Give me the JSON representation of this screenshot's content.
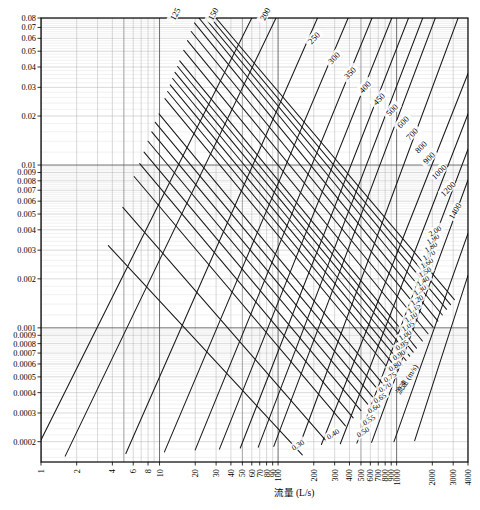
{
  "figure": {
    "kind": "hydraulic-nomogram",
    "width": 480,
    "height": 510,
    "background": "#ffffff",
    "line_color": "#1a1a1a",
    "grid_major_color": "#555555",
    "grid_minor_color": "#aaaaaa"
  },
  "axes": {
    "x_title": "流量 (L/s)",
    "y_title": "",
    "velocity_title": "流速 (m/s)",
    "x_scale": "log",
    "y_scale": "log",
    "x_range": [
      1,
      4000
    ],
    "y_range": [
      0.00015,
      0.08
    ],
    "grid": true
  },
  "x_ticks": [
    {
      "value": 1,
      "label": "1"
    },
    {
      "value": 2,
      "label": "2"
    },
    {
      "value": 4,
      "label": "4"
    },
    {
      "value": 6,
      "label": "6"
    },
    {
      "value": 8,
      "label": "8"
    },
    {
      "value": 10,
      "label": "10"
    },
    {
      "value": 20,
      "label": "20"
    },
    {
      "value": 30,
      "label": "30"
    },
    {
      "value": 40,
      "label": "40"
    },
    {
      "value": 50,
      "label": "50"
    },
    {
      "value": 60,
      "label": "60"
    },
    {
      "value": 70,
      "label": "70"
    },
    {
      "value": 80,
      "label": "80"
    },
    {
      "value": 90,
      "label": "90"
    },
    {
      "value": 100,
      "label": "100"
    },
    {
      "value": 200,
      "label": "200"
    },
    {
      "value": 300,
      "label": "300"
    },
    {
      "value": 400,
      "label": "400"
    },
    {
      "value": 500,
      "label": "500"
    },
    {
      "value": 600,
      "label": "600"
    },
    {
      "value": 700,
      "label": "700"
    },
    {
      "value": 800,
      "label": "800"
    },
    {
      "value": 900,
      "label": "900"
    },
    {
      "value": 1000,
      "label": "1000"
    },
    {
      "value": 2000,
      "label": "2000"
    },
    {
      "value": 3000,
      "label": "3000"
    },
    {
      "value": 4000,
      "label": "4000"
    }
  ],
  "y_ticks": [
    {
      "value": 0.08,
      "label": "0.08"
    },
    {
      "value": 0.07,
      "label": "0.07"
    },
    {
      "value": 0.06,
      "label": "0.06"
    },
    {
      "value": 0.05,
      "label": "0.05"
    },
    {
      "value": 0.04,
      "label": "0.04"
    },
    {
      "value": 0.03,
      "label": "0.03"
    },
    {
      "value": 0.02,
      "label": "0.02"
    },
    {
      "value": 0.01,
      "label": "0.01"
    },
    {
      "value": 0.009,
      "label": "0.009"
    },
    {
      "value": 0.008,
      "label": "0.008"
    },
    {
      "value": 0.007,
      "label": "0.007"
    },
    {
      "value": 0.006,
      "label": "0.006"
    },
    {
      "value": 0.005,
      "label": "0.005"
    },
    {
      "value": 0.004,
      "label": "0.004"
    },
    {
      "value": 0.003,
      "label": "0.003"
    },
    {
      "value": 0.002,
      "label": "0.002"
    },
    {
      "value": 0.001,
      "label": "0.001"
    },
    {
      "value": 0.0009,
      "label": "0.0009"
    },
    {
      "value": 0.0008,
      "label": "0.0008"
    },
    {
      "value": 0.0007,
      "label": "0.0007"
    },
    {
      "value": 0.0006,
      "label": "0.0006"
    },
    {
      "value": 0.0005,
      "label": "0.0005"
    },
    {
      "value": 0.0004,
      "label": "0.0004"
    },
    {
      "value": 0.0003,
      "label": "0.0003"
    },
    {
      "value": 0.0002,
      "label": "0.0002"
    }
  ],
  "chart_data": {
    "type": "line",
    "title": "",
    "subtitle": "",
    "xlabel": "流量 (L/s)",
    "ylabel": "",
    "xlim": [
      1,
      4000
    ],
    "ylim": [
      0.00015,
      0.08
    ],
    "xscale": "log",
    "yscale": "log",
    "grid": true,
    "legend_position": "none",
    "annotations": [
      "流量 (L/s)",
      "流速 (m/s)"
    ],
    "families": [
      {
        "name": "diameter",
        "unit": "mm",
        "label_position": "top-right-edge",
        "description": "Pipe diameter lines running lower-left to upper-right, labelled at their upper end",
        "values": [
          125,
          150,
          200,
          250,
          300,
          350,
          400,
          450,
          500,
          600,
          700,
          800,
          900,
          1000,
          1200,
          1400
        ]
      },
      {
        "name": "velocity",
        "unit": "m/s",
        "label_position": "right-and-bottom-edge",
        "description": "Velocity lines running upper-left to lower-right, labelled along the right and lower-right border",
        "values": [
          0.3,
          0.4,
          0.5,
          0.55,
          0.6,
          0.65,
          0.7,
          0.75,
          0.8,
          0.9,
          0.95,
          1.0,
          1.05,
          1.1,
          1.15,
          1.2,
          1.3,
          1.4,
          1.5,
          1.6,
          1.7,
          1.8,
          1.9,
          2.0
        ]
      }
    ],
    "series": [
      {
        "name": "D125",
        "family": "diameter",
        "value": 125,
        "points": [
          [
            1,
            0.000205
          ],
          [
            60,
            0.08
          ]
        ]
      },
      {
        "name": "D150",
        "family": "diameter",
        "value": 150,
        "points": [
          [
            1.6,
            0.000163
          ],
          [
            96,
            0.08
          ]
        ]
      },
      {
        "name": "D200",
        "family": "diameter",
        "value": 200,
        "points": [
          [
            5.2,
            0.000169
          ],
          [
            215,
            0.08
          ]
        ]
      },
      {
        "name": "D250",
        "family": "diameter",
        "value": 250,
        "points": [
          [
            11,
            0.000173
          ],
          [
            390,
            0.08
          ]
        ]
      },
      {
        "name": "D300",
        "family": "diameter",
        "value": 300,
        "points": [
          [
            20,
            0.000178
          ],
          [
            620,
            0.08
          ]
        ]
      },
      {
        "name": "D350",
        "family": "diameter",
        "value": 350,
        "points": [
          [
            32,
            0.00018
          ],
          [
            910,
            0.08
          ]
        ]
      },
      {
        "name": "D400",
        "family": "diameter",
        "value": 400,
        "points": [
          [
            48,
            0.000183
          ],
          [
            1260,
            0.08
          ]
        ]
      },
      {
        "name": "D450",
        "family": "diameter",
        "value": 450,
        "points": [
          [
            68,
            0.000185
          ],
          [
            1660,
            0.08
          ]
        ]
      },
      {
        "name": "D500",
        "family": "diameter",
        "value": 500,
        "points": [
          [
            92,
            0.000187
          ],
          [
            2120,
            0.08
          ]
        ]
      },
      {
        "name": "D600",
        "family": "diameter",
        "value": 600,
        "points": [
          [
            152,
            0.00019
          ],
          [
            3300,
            0.08
          ]
        ]
      },
      {
        "name": "D700",
        "family": "diameter",
        "value": 700,
        "points": [
          [
            232,
            0.000192
          ],
          [
            4000,
            0.0365
          ]
        ]
      },
      {
        "name": "D800",
        "family": "diameter",
        "value": 800,
        "points": [
          [
            335,
            0.000194
          ],
          [
            4000,
            0.0206
          ]
        ]
      },
      {
        "name": "D900",
        "family": "diameter",
        "value": 900,
        "points": [
          [
            462,
            0.000196
          ],
          [
            4000,
            0.0125
          ]
        ]
      },
      {
        "name": "D1000",
        "family": "diameter",
        "value": 1000,
        "points": [
          [
            615,
            0.000198
          ],
          [
            4000,
            0.0081
          ]
        ]
      },
      {
        "name": "D1200",
        "family": "diameter",
        "value": 1200,
        "points": [
          [
            950,
            0.0002
          ],
          [
            4000,
            0.0038
          ]
        ]
      },
      {
        "name": "D1400",
        "family": "diameter",
        "value": 1400,
        "points": [
          [
            1420,
            0.000203
          ],
          [
            4000,
            0.0021
          ]
        ]
      },
      {
        "name": "v0.30",
        "family": "velocity",
        "value": 0.3,
        "points": [
          [
            3.7,
            0.0032
          ],
          [
            160,
            0.000166
          ]
        ]
      },
      {
        "name": "v0.40",
        "family": "velocity",
        "value": 0.4,
        "points": [
          [
            4.9,
            0.0055
          ],
          [
            250,
            0.000205
          ]
        ]
      },
      {
        "name": "v0.50",
        "family": "velocity",
        "value": 0.5,
        "points": [
          [
            6.1,
            0.0085
          ],
          [
            370,
            0.00025
          ]
        ]
      },
      {
        "name": "v0.55",
        "family": "velocity",
        "value": 0.55,
        "points": [
          [
            6.8,
            0.0102
          ],
          [
            430,
            0.00028
          ]
        ]
      },
      {
        "name": "v0.60",
        "family": "velocity",
        "value": 0.6,
        "points": [
          [
            7.4,
            0.012
          ],
          [
            500,
            0.00031
          ]
        ]
      },
      {
        "name": "v0.65",
        "family": "velocity",
        "value": 0.65,
        "points": [
          [
            8.0,
            0.014
          ],
          [
            570,
            0.00034
          ]
        ]
      },
      {
        "name": "v0.70",
        "family": "velocity",
        "value": 0.7,
        "points": [
          [
            8.6,
            0.016
          ],
          [
            640,
            0.00037
          ]
        ]
      },
      {
        "name": "v0.75",
        "family": "velocity",
        "value": 0.75,
        "points": [
          [
            9.2,
            0.0183
          ],
          [
            710,
            0.00041
          ]
        ]
      },
      {
        "name": "v0.80",
        "family": "velocity",
        "value": 0.8,
        "points": [
          [
            9.9,
            0.0206
          ],
          [
            790,
            0.00044
          ]
        ]
      },
      {
        "name": "v0.90",
        "family": "velocity",
        "value": 0.9,
        "points": [
          [
            11.1,
            0.0256
          ],
          [
            950,
            0.00051
          ]
        ]
      },
      {
        "name": "v0.95",
        "family": "velocity",
        "value": 0.95,
        "points": [
          [
            11.7,
            0.0283
          ],
          [
            1030,
            0.00055
          ]
        ]
      },
      {
        "name": "v1.00",
        "family": "velocity",
        "value": 1.0,
        "points": [
          [
            12.3,
            0.0311
          ],
          [
            1120,
            0.00059
          ]
        ]
      },
      {
        "name": "v1.05",
        "family": "velocity",
        "value": 1.05,
        "points": [
          [
            12.9,
            0.034
          ],
          [
            1200,
            0.00063
          ]
        ]
      },
      {
        "name": "v1.10",
        "family": "velocity",
        "value": 1.1,
        "points": [
          [
            13.5,
            0.0371
          ],
          [
            1290,
            0.00067
          ]
        ]
      },
      {
        "name": "v1.15",
        "family": "velocity",
        "value": 1.15,
        "points": [
          [
            14.2,
            0.0403
          ],
          [
            1380,
            0.00071
          ]
        ]
      },
      {
        "name": "v1.20",
        "family": "velocity",
        "value": 1.2,
        "points": [
          [
            14.8,
            0.0436
          ],
          [
            1470,
            0.00075
          ]
        ]
      },
      {
        "name": "v1.30",
        "family": "velocity",
        "value": 1.3,
        "points": [
          [
            16.0,
            0.0506
          ],
          [
            1650,
            0.00083
          ]
        ]
      },
      {
        "name": "v1.40",
        "family": "velocity",
        "value": 1.4,
        "points": [
          [
            17.2,
            0.0581
          ],
          [
            1840,
            0.00092
          ]
        ]
      },
      {
        "name": "v1.50",
        "family": "velocity",
        "value": 1.5,
        "points": [
          [
            18.5,
            0.0661
          ],
          [
            2030,
            0.00101
          ]
        ]
      },
      {
        "name": "v1.60",
        "family": "velocity",
        "value": 1.6,
        "points": [
          [
            19.7,
            0.0746
          ],
          [
            2230,
            0.0011
          ]
        ]
      },
      {
        "name": "v1.70",
        "family": "velocity",
        "value": 1.7,
        "points": [
          [
            21.5,
            0.08
          ],
          [
            2430,
            0.0012
          ]
        ]
      },
      {
        "name": "v1.80",
        "family": "velocity",
        "value": 1.8,
        "points": [
          [
            24.2,
            0.08
          ],
          [
            2640,
            0.0013
          ]
        ]
      },
      {
        "name": "v1.90",
        "family": "velocity",
        "value": 1.9,
        "points": [
          [
            27.0,
            0.08
          ],
          [
            2850,
            0.00139
          ]
        ]
      },
      {
        "name": "v2.00",
        "family": "velocity",
        "value": 2.0,
        "points": [
          [
            29.9,
            0.08
          ],
          [
            3070,
            0.00149
          ]
        ]
      }
    ]
  },
  "diameter_labels": [
    {
      "label": "125",
      "x": 175,
      "y": 14,
      "angle": -62
    },
    {
      "label": "150",
      "x": 213,
      "y": 14,
      "angle": -62
    },
    {
      "label": "200",
      "x": 265,
      "y": 14,
      "angle": -62
    },
    {
      "label": "250",
      "x": 314,
      "y": 38,
      "angle": -45
    },
    {
      "label": "300",
      "x": 334,
      "y": 58,
      "angle": -45
    },
    {
      "label": "350",
      "x": 350,
      "y": 73,
      "angle": -45
    },
    {
      "label": "400",
      "x": 365,
      "y": 87,
      "angle": -45
    },
    {
      "label": "450",
      "x": 379,
      "y": 99,
      "angle": -45
    },
    {
      "label": "500",
      "x": 392,
      "y": 110,
      "angle": -45
    },
    {
      "label": "600",
      "x": 403,
      "y": 122,
      "angle": -45
    },
    {
      "label": "700",
      "x": 412,
      "y": 134,
      "angle": -45
    },
    {
      "label": "800",
      "x": 421,
      "y": 147,
      "angle": -45
    },
    {
      "label": "900",
      "x": 429,
      "y": 158,
      "angle": -45
    },
    {
      "label": "1000",
      "x": 439,
      "y": 172,
      "angle": -45
    },
    {
      "label": "1200",
      "x": 448,
      "y": 189,
      "angle": -45
    },
    {
      "label": "1400",
      "x": 455,
      "y": 211,
      "angle": -60
    }
  ],
  "velocity_labels": [
    {
      "label": "0.30",
      "x": 298,
      "y": 445,
      "angle": -33
    },
    {
      "label": "0.40",
      "x": 333,
      "y": 434,
      "angle": -33
    },
    {
      "label": "0.50",
      "x": 363,
      "y": 432,
      "angle": -33
    },
    {
      "label": "0.55",
      "x": 369,
      "y": 420,
      "angle": -33
    },
    {
      "label": "0.60",
      "x": 374,
      "y": 408,
      "angle": -33
    },
    {
      "label": "0.65",
      "x": 380,
      "y": 398,
      "angle": -33
    },
    {
      "label": "0.70",
      "x": 385,
      "y": 387,
      "angle": -33
    },
    {
      "label": "0.75",
      "x": 390,
      "y": 377,
      "angle": -33
    },
    {
      "label": "0.80",
      "x": 395,
      "y": 366,
      "angle": -33
    },
    {
      "label": "0.90",
      "x": 399,
      "y": 355,
      "angle": -33
    },
    {
      "label": "0.95",
      "x": 402,
      "y": 345,
      "angle": -33
    },
    {
      "label": "1.00",
      "x": 405,
      "y": 335,
      "angle": -33
    },
    {
      "label": "1.05",
      "x": 408,
      "y": 326,
      "angle": -33
    },
    {
      "label": "1.10",
      "x": 411,
      "y": 317,
      "angle": -33
    },
    {
      "label": "1.15",
      "x": 414,
      "y": 308,
      "angle": -33
    },
    {
      "label": "1.20",
      "x": 417,
      "y": 300,
      "angle": -33
    },
    {
      "label": "1.30",
      "x": 420,
      "y": 290,
      "angle": -33
    },
    {
      "label": "1.40",
      "x": 423,
      "y": 281,
      "angle": -33
    },
    {
      "label": "1.50",
      "x": 425,
      "y": 272,
      "angle": -33
    },
    {
      "label": "1.60",
      "x": 427,
      "y": 263,
      "angle": -33
    },
    {
      "label": "1.70",
      "x": 429,
      "y": 255,
      "angle": -33
    },
    {
      "label": "1.80",
      "x": 431,
      "y": 247,
      "angle": -33
    },
    {
      "label": "1.90",
      "x": 433,
      "y": 239,
      "angle": -33
    },
    {
      "label": "2.00",
      "x": 435,
      "y": 231,
      "angle": -33
    }
  ]
}
